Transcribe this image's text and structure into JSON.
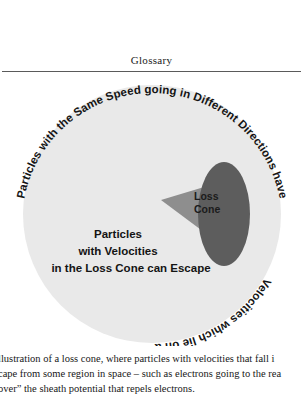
{
  "header": {
    "title": "Glossary"
  },
  "figure": {
    "sphere_label_curved_top": "Particles with the Same Speed going in Different Directions have",
    "sphere_label_curved_bottom": "Velocities which lie on a Sphere",
    "cone_label_line1": "Loss",
    "cone_label_line2": "Cone",
    "inner_text_line1": "Particles",
    "inner_text_line2": "with Velocities",
    "inner_text_line3": "in the Loss Cone can Escape",
    "colors": {
      "sphere": "#e8e8e8",
      "cone": "#8f8f8f",
      "cone_cap": "#5e5e5e",
      "text": "#141414",
      "page_background": "#ffffff",
      "rule": "#5a5a5a"
    }
  },
  "caption": {
    "line1": "llustration of a loss cone, where particles with velocities that fall i",
    "line2": "cape from some region in space – such as electrons going to the rea",
    "line3": "over” the sheath potential that repels electrons."
  }
}
